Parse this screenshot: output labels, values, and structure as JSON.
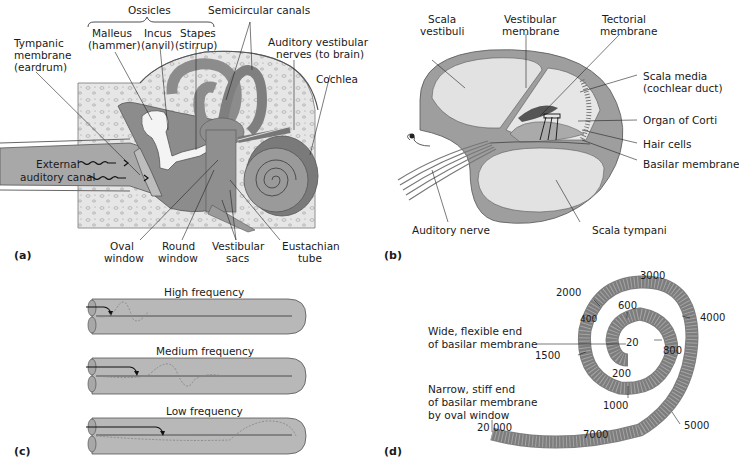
{
  "panels": {
    "a": {
      "tag": "(a)",
      "labels": {
        "ossicles": "Ossicles",
        "malleus_1": "Malleus",
        "malleus_2": "(hammer)",
        "incus_1": "Incus",
        "incus_2": "(anvil)",
        "stapes_1": "Stapes",
        "stapes_2": "(stirrup)",
        "semicircular": "Semicircular canals",
        "tympanic_1": "Tympanic",
        "tympanic_2": "membrane",
        "tympanic_3": "(eardrum)",
        "auditory_vest_1": "Auditory vestibular",
        "auditory_vest_2": "nerves (to brain)",
        "cochlea": "Cochlea",
        "external_1": "External",
        "external_2": "auditory canal",
        "oval_1": "Oval",
        "oval_2": "window",
        "round_1": "Round",
        "round_2": "window",
        "vestsacs_1": "Vestibular",
        "vestsacs_2": "sacs",
        "eust_1": "Eustachian",
        "eust_2": "tube"
      }
    },
    "b": {
      "tag": "(b)",
      "labels": {
        "scala_vest_1": "Scala",
        "scala_vest_2": "vestibuli",
        "vest_mem_1": "Vestibular",
        "vest_mem_2": "membrane",
        "tect_1": "Tectorial",
        "tect_2": "membrane",
        "scala_media_1": "Scala media",
        "scala_media_2": "(cochlear duct)",
        "organ": "Organ of Corti",
        "hair": "Hair cells",
        "basilar": "Basilar membrane",
        "aud_nerve": "Auditory nerve",
        "scala_tymp": "Scala tympani"
      }
    },
    "c": {
      "tag": "(c)",
      "rows": [
        {
          "label": "High frequency"
        },
        {
          "label": "Medium frequency"
        },
        {
          "label": "Low frequency"
        }
      ]
    },
    "d": {
      "tag": "(d)",
      "labels": {
        "wide_1": "Wide, flexible end",
        "wide_2": "of basilar membrane",
        "narrow_1": "Narrow, stiff end",
        "narrow_2": "of basilar membrane",
        "narrow_3": "by oval window"
      },
      "frequencies": {
        "f20": "20",
        "f200": "200",
        "f400": "400",
        "f600": "600",
        "f800": "800",
        "f1000": "1000",
        "f1500": "1500",
        "f2000": "2000",
        "f3000": "3000",
        "f4000": "4000",
        "f5000": "5000",
        "f7000": "7000",
        "f20000": "20 000"
      }
    }
  },
  "colors": {
    "bone": "#e4e4e4",
    "tissue": "#9a9a9a",
    "dark": "#6e6e6e",
    "light": "#d8d8d8",
    "ossicle": "#f2f2f2"
  }
}
